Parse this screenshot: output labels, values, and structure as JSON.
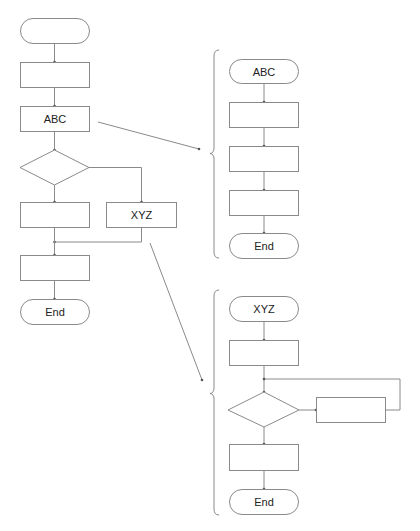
{
  "colors": {
    "stroke": "#8a8a8a",
    "text": "#222222",
    "background": "#ffffff"
  },
  "main_flow": {
    "start": {
      "label": ""
    },
    "step1": {
      "label": ""
    },
    "abc": {
      "label": "ABC"
    },
    "decision": {
      "label": ""
    },
    "branch_left": {
      "label": ""
    },
    "xyz": {
      "label": "XYZ"
    },
    "step_after_merge": {
      "label": ""
    },
    "end": {
      "label": "End"
    }
  },
  "abc_subflow": {
    "start": {
      "label": "ABC"
    },
    "step1": {
      "label": ""
    },
    "step2": {
      "label": ""
    },
    "step3": {
      "label": ""
    },
    "end": {
      "label": "End"
    }
  },
  "xyz_subflow": {
    "start": {
      "label": "XYZ"
    },
    "step1": {
      "label": ""
    },
    "decision": {
      "label": ""
    },
    "loop_step": {
      "label": ""
    },
    "step2": {
      "label": ""
    },
    "end": {
      "label": "End"
    }
  }
}
